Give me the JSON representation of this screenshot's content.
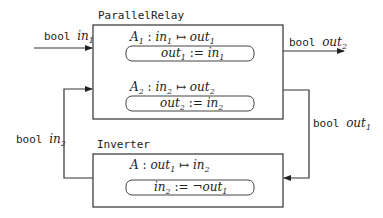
{
  "components": [
    {
      "name": "ParallelRelay",
      "actions": [
        {
          "label": "A",
          "label_sub": "1",
          "mapping_from": "in",
          "mapping_from_sub": "1",
          "mapping_to": "out",
          "mapping_to_sub": "1",
          "assign_lhs": "out",
          "assign_lhs_sub": "1",
          "assign_op": ":=",
          "assign_rhs_prefix": "",
          "assign_rhs": "in",
          "assign_rhs_sub": "1"
        },
        {
          "label": "A",
          "label_sub": "2",
          "mapping_from": "in",
          "mapping_from_sub": "2",
          "mapping_to": "out",
          "mapping_to_sub": "2",
          "assign_lhs": "out",
          "assign_lhs_sub": "2",
          "assign_op": ":=",
          "assign_rhs_prefix": "",
          "assign_rhs": "in",
          "assign_rhs_sub": "2"
        }
      ]
    },
    {
      "name": "Inverter",
      "actions": [
        {
          "label": "A",
          "label_sub": "",
          "mapping_from": "out",
          "mapping_from_sub": "1",
          "mapping_to": "in",
          "mapping_to_sub": "2",
          "assign_lhs": "in",
          "assign_lhs_sub": "2",
          "assign_op": ":=",
          "assign_rhs_prefix": "¬",
          "assign_rhs": "out",
          "assign_rhs_sub": "1"
        }
      ]
    }
  ],
  "wires": {
    "in1": {
      "type": "bool",
      "var": "in",
      "sub": "1"
    },
    "out2": {
      "type": "bool",
      "var": "out",
      "sub": "2"
    },
    "in2": {
      "type": "bool",
      "var": "in",
      "sub": "2"
    },
    "out1": {
      "type": "bool",
      "var": "out",
      "sub": "1"
    }
  },
  "symbols": {
    "colon": ":",
    "mapsto": "↦"
  }
}
